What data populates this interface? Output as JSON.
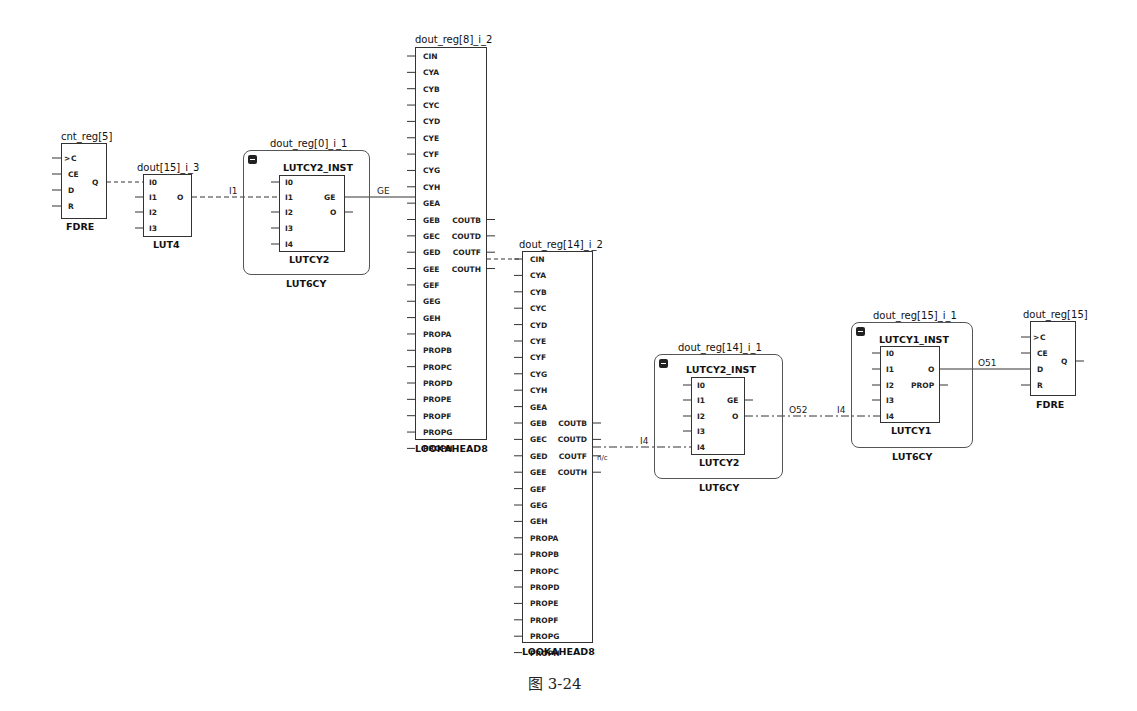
{
  "caption": "图 3-24",
  "cells": {
    "cnt_reg5": {
      "name": "cnt_reg[5]",
      "type": "FDRE",
      "inputs": [
        "C",
        "CE",
        "D",
        "R"
      ],
      "output": "Q"
    },
    "lut4": {
      "name": "dout[15]_i_3",
      "type": "LUT4",
      "inputs": [
        "I0",
        "I1",
        "I2",
        "I3"
      ],
      "output": "O"
    },
    "lut6cy_0": {
      "name": "dout_reg[0]_i_1",
      "type": "LUT6CY",
      "inst": "LUTCY2_INST",
      "inst_type": "LUTCY2",
      "inputs": [
        "I0",
        "I1",
        "I2",
        "I3",
        "I4"
      ],
      "outputs": [
        "GE",
        "O"
      ]
    },
    "lookahead_8": {
      "name": "dout_reg[8]_i_2",
      "type": "LOOKAHEAD8",
      "inputs": [
        "CIN",
        "CYA",
        "CYB",
        "CYC",
        "CYD",
        "CYE",
        "CYF",
        "CYG",
        "CYH",
        "GEA",
        "GEB",
        "GEC",
        "GED",
        "GEE",
        "GEF",
        "GEG",
        "GEH",
        "PROPA",
        "PROPB",
        "PROPC",
        "PROPD",
        "PROPE",
        "PROPF",
        "PROPG",
        "PROPH"
      ],
      "outputs": [
        "COUTB",
        "COUTD",
        "COUTF",
        "COUTH"
      ]
    },
    "lookahead_14": {
      "name": "dout_reg[14]_i_2",
      "type": "LOOKAHEAD8",
      "inputs": [
        "CIN",
        "CYA",
        "CYB",
        "CYC",
        "CYD",
        "CYE",
        "CYF",
        "CYG",
        "CYH",
        "GEA",
        "GEB",
        "GEC",
        "GED",
        "GEE",
        "GEF",
        "GEG",
        "GEH",
        "PROPA",
        "PROPB",
        "PROPC",
        "PROPD",
        "PROPE",
        "PROPF",
        "PROPG",
        "PROPH"
      ],
      "outputs": [
        "COUTB",
        "COUTD",
        "COUTF",
        "COUTH"
      ]
    },
    "lut6cy_14": {
      "name": "dout_reg[14]_i_1",
      "type": "LUT6CY",
      "inst": "LUTCY2_INST",
      "inst_type": "LUTCY2",
      "inputs": [
        "I0",
        "I1",
        "I2",
        "I3",
        "I4"
      ],
      "outputs": [
        "GE",
        "O"
      ]
    },
    "lut6cy_15": {
      "name": "dout_reg[15]_i_1",
      "type": "LUT6CY",
      "inst": "LUTCY1_INST",
      "inst_type": "LUTCY1",
      "inputs": [
        "I0",
        "I1",
        "I2",
        "I3",
        "I4"
      ],
      "outputs": [
        "O",
        "PROP"
      ]
    },
    "dout_reg15": {
      "name": "dout_reg[15]",
      "type": "FDRE",
      "inputs": [
        "C",
        "CE",
        "D",
        "R"
      ],
      "output": "Q"
    }
  },
  "nets": {
    "i1": "I1",
    "ge": "GE",
    "i4_a": "I4",
    "nc": "n/c",
    "o52": "O52",
    "i4_b": "I4",
    "o51": "O51"
  }
}
